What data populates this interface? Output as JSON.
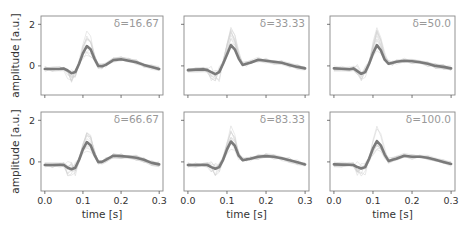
{
  "chart_data": {
    "type": "line",
    "layout": {
      "rows": 2,
      "cols": 3,
      "sharex": true,
      "sharey": true
    },
    "xlabel": "time [s]",
    "ylabel": "amplitude [a.u.]",
    "xlim": [
      -0.01,
      0.31
    ],
    "ylim": [
      -1.4,
      2.4
    ],
    "xticks": [
      0.0,
      0.1,
      0.2,
      0.3
    ],
    "xtick_labels": [
      "0.0",
      "0.1",
      "0.2",
      "0.3"
    ],
    "yticks": [
      0,
      2
    ],
    "ytick_labels": [
      "0",
      "2"
    ],
    "grid": false,
    "colors": {
      "mean": "#7a7a7a",
      "traces": "#d0d0d0",
      "annotation": "#999999",
      "frame": "#888888"
    },
    "x": [
      0.0,
      0.02,
      0.04,
      0.05,
      0.06,
      0.07,
      0.08,
      0.09,
      0.1,
      0.11,
      0.12,
      0.13,
      0.14,
      0.15,
      0.16,
      0.18,
      0.2,
      0.22,
      0.24,
      0.26,
      0.28,
      0.3
    ],
    "panels": [
      {
        "label": "δ=16.67",
        "mean": [
          -0.15,
          -0.15,
          -0.14,
          -0.13,
          -0.22,
          -0.35,
          -0.3,
          0.1,
          0.6,
          0.95,
          0.8,
          0.35,
          0.0,
          -0.02,
          0.05,
          0.28,
          0.32,
          0.25,
          0.18,
          0.05,
          -0.05,
          -0.15
        ]
      },
      {
        "label": "δ=33.33",
        "mean": [
          -0.2,
          -0.18,
          -0.17,
          -0.2,
          -0.3,
          -0.4,
          -0.3,
          0.1,
          0.55,
          1.0,
          0.8,
          0.35,
          0.05,
          0.1,
          0.15,
          0.3,
          0.25,
          0.2,
          0.15,
          0.05,
          -0.05,
          -0.12
        ]
      },
      {
        "label": "δ=50.0",
        "mean": [
          -0.12,
          -0.14,
          -0.16,
          -0.12,
          -0.25,
          -0.38,
          -0.3,
          0.1,
          0.6,
          1.0,
          0.75,
          0.3,
          0.1,
          0.15,
          0.2,
          0.25,
          0.22,
          0.18,
          0.1,
          0.0,
          -0.05,
          -0.12
        ]
      },
      {
        "label": "δ=66.67",
        "mean": [
          -0.15,
          -0.15,
          -0.14,
          -0.15,
          -0.28,
          -0.35,
          -0.28,
          0.1,
          0.6,
          0.95,
          0.8,
          0.35,
          0.0,
          0.0,
          0.1,
          0.3,
          0.28,
          0.25,
          0.2,
          0.1,
          -0.05,
          -0.12
        ]
      },
      {
        "label": "δ=83.33",
        "mean": [
          -0.15,
          -0.15,
          -0.14,
          -0.15,
          -0.25,
          -0.33,
          -0.25,
          0.1,
          0.6,
          0.98,
          0.78,
          0.3,
          0.08,
          0.12,
          0.15,
          0.25,
          0.28,
          0.25,
          0.18,
          0.08,
          -0.02,
          -0.12
        ]
      },
      {
        "label": "δ=100.0",
        "mean": [
          -0.12,
          -0.13,
          -0.14,
          -0.15,
          -0.25,
          -0.32,
          -0.25,
          0.15,
          0.65,
          1.0,
          0.8,
          0.35,
          0.05,
          0.1,
          0.15,
          0.3,
          0.25,
          0.25,
          0.2,
          0.1,
          0.0,
          -0.1
        ]
      }
    ]
  }
}
